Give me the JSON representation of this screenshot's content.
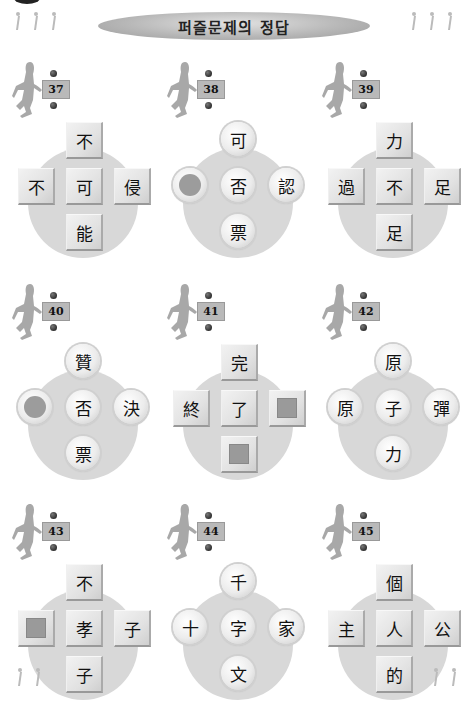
{
  "header": {
    "title": "퍼즐문제의 정답",
    "decorations": [
      "walking-figures-left",
      "walking-figures-right"
    ]
  },
  "puzzles": [
    {
      "number": "37",
      "shape": "square",
      "top": "不",
      "left": "不",
      "center": "可",
      "right": "侵",
      "bottom": "能",
      "blanks": []
    },
    {
      "number": "38",
      "shape": "round",
      "top": "可",
      "left": "",
      "center": "否",
      "right": "認",
      "bottom": "票",
      "blanks": [
        "left"
      ]
    },
    {
      "number": "39",
      "shape": "square",
      "top": "力",
      "left": "過",
      "center": "不",
      "right": "足",
      "bottom": "足",
      "blanks": []
    },
    {
      "number": "40",
      "shape": "round",
      "top": "贊",
      "left": "",
      "center": "否",
      "right": "決",
      "bottom": "票",
      "blanks": [
        "left"
      ]
    },
    {
      "number": "41",
      "shape": "square",
      "top": "完",
      "left": "終",
      "center": "了",
      "right": "",
      "bottom": "",
      "blanks": [
        "right",
        "bottom"
      ]
    },
    {
      "number": "42",
      "shape": "round",
      "top": "原",
      "left": "原",
      "center": "子",
      "right": "彈",
      "bottom": "力",
      "blanks": []
    },
    {
      "number": "43",
      "shape": "square",
      "top": "不",
      "left": "",
      "center": "孝",
      "right": "子",
      "bottom": "子",
      "blanks": [
        "left"
      ]
    },
    {
      "number": "44",
      "shape": "round",
      "top": "千",
      "left": "十",
      "center": "字",
      "right": "家",
      "bottom": "文",
      "blanks": []
    },
    {
      "number": "45",
      "shape": "square",
      "top": "個",
      "left": "主",
      "center": "人",
      "right": "公",
      "bottom": "的",
      "blanks": []
    }
  ],
  "colors": {
    "disc": "#d8d8d8",
    "blank": "#9a9a9a",
    "number_box": "#b9b9b9",
    "banner": "#b8b8b8"
  }
}
